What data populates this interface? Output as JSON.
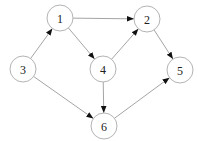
{
  "diagram": {
    "type": "directed-graph",
    "node_radius": 13,
    "colors": {
      "node_stroke": "#b4b4b4",
      "edge": "#9a9a9a",
      "arrow": "#111111",
      "label": "#222222"
    },
    "nodes": [
      {
        "id": "1",
        "label": "1",
        "x": 60,
        "y": 18
      },
      {
        "id": "2",
        "label": "2",
        "x": 147,
        "y": 19
      },
      {
        "id": "3",
        "label": "3",
        "x": 23,
        "y": 69
      },
      {
        "id": "4",
        "label": "4",
        "x": 103,
        "y": 69
      },
      {
        "id": "5",
        "label": "5",
        "x": 180,
        "y": 70
      },
      {
        "id": "6",
        "label": "6",
        "x": 104,
        "y": 126
      }
    ],
    "edges": [
      {
        "from": "1",
        "to": "2"
      },
      {
        "from": "1",
        "to": "4"
      },
      {
        "from": "3",
        "to": "1"
      },
      {
        "from": "3",
        "to": "6"
      },
      {
        "from": "4",
        "to": "2"
      },
      {
        "from": "4",
        "to": "6"
      },
      {
        "from": "2",
        "to": "5"
      },
      {
        "from": "6",
        "to": "5"
      }
    ]
  }
}
